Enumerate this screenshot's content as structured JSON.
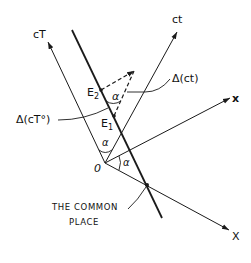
{
  "diagram": {
    "axes": {
      "cT": {
        "label": "cT"
      },
      "ct": {
        "label": "ct"
      },
      "x_prime": {
        "label": "x"
      },
      "X": {
        "label": "X"
      }
    },
    "origin": {
      "label": "0"
    },
    "events": {
      "E1": {
        "label": "E",
        "sub": "1"
      },
      "E2": {
        "label": "E",
        "sub": "2"
      }
    },
    "angles": {
      "alpha_label": "α"
    },
    "annotations": {
      "delta_cT0": "Δ(cT°)",
      "delta_ct": "Δ(ct)",
      "common_place_line1": "THE COMMON",
      "common_place_line2": "PLACE"
    },
    "colors": {
      "ink": "#1a1a1a",
      "background": "#ffffff"
    }
  }
}
